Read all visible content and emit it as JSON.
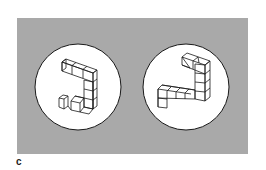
{
  "figure": {
    "label": "c",
    "background_color": "#a9a9a9",
    "disc_color": "#ffffff",
    "stroke_color": "#1a1a1a",
    "stimuli": [
      {
        "name": "left-object",
        "description": "3D cube-assembly (Shepard-Metzler style), rotated view"
      },
      {
        "name": "right-object",
        "description": "3D cube-assembly (Shepard-Metzler style), rotated view"
      }
    ]
  }
}
